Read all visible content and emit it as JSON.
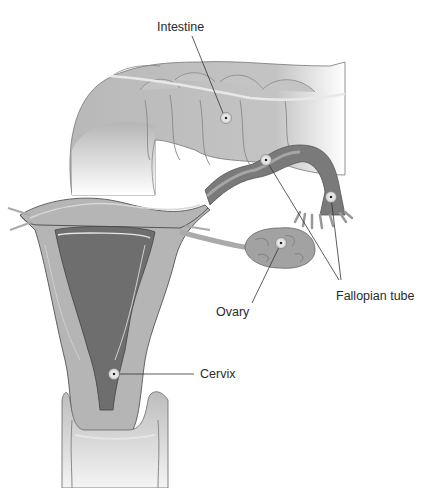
{
  "diagram": {
    "labels": {
      "intestine": "Intestine",
      "fallopian_tube": "Fallopian tube",
      "ovary": "Ovary",
      "cervix": "Cervix"
    },
    "colors": {
      "background": "#ffffff",
      "tissue_light": "#c9c9c9",
      "tissue_mid": "#a9a9a9",
      "tissue_dark": "#6e6e6e",
      "outline": "#555555",
      "leader_line": "#333333",
      "text": "#2a2a2a"
    }
  }
}
